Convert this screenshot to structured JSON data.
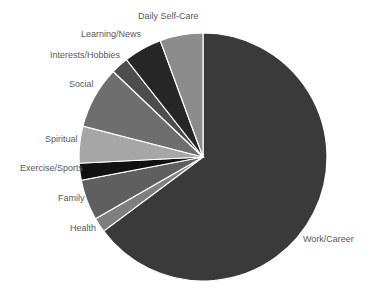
{
  "chart_data": {
    "type": "pie",
    "title": "",
    "start_angle_deg": 0,
    "direction": "clockwise",
    "categories": [
      "Work/Career",
      "Health",
      "Family",
      "Exercise/Sports",
      "Spiritual",
      "Social",
      "Interests/Hobbies",
      "Learning/News",
      "Daily Self-Care"
    ],
    "values": [
      64.8,
      1.9,
      5.3,
      2.2,
      4.8,
      8.1,
      2.3,
      5.0,
      5.6
    ],
    "unit": "percent",
    "colors": [
      "#3a3a3a",
      "#7f7f7f",
      "#5f5f5f",
      "#111111",
      "#a6a6a6",
      "#6e6e6e",
      "#4d4d4d",
      "#262626",
      "#8c8c8c"
    ],
    "legend": "none (category labels placed outside slices)"
  },
  "labels": [
    {
      "text": "Work/Career",
      "x": 303,
      "y": 240
    },
    {
      "text": "Health",
      "x": 70,
      "y": 229
    },
    {
      "text": "Family",
      "x": 58,
      "y": 199
    },
    {
      "text": "Exercise/Sports",
      "x": 20,
      "y": 169
    },
    {
      "text": "Spiritual",
      "x": 45,
      "y": 140
    },
    {
      "text": "Social",
      "x": 69,
      "y": 85
    },
    {
      "text": "Interests/Hobbies",
      "x": 50,
      "y": 56
    },
    {
      "text": "Learning/News",
      "x": 81,
      "y": 35
    },
    {
      "text": "Daily Self-Care",
      "x": 138,
      "y": 17
    }
  ]
}
